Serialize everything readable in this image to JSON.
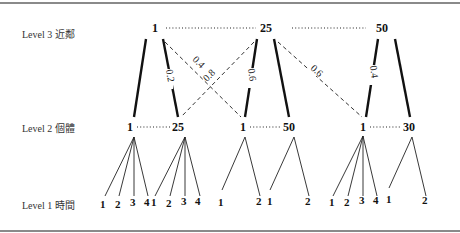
{
  "levels": [
    {
      "label": "Level 3 近鄰"
    },
    {
      "label": "Level 2 個體"
    },
    {
      "label": "Level 1 時間"
    }
  ],
  "level3": {
    "nodes": [
      "1",
      "25",
      "50"
    ]
  },
  "level2": {
    "nodes": [
      "1",
      "25",
      "1",
      "50",
      "1",
      "30"
    ]
  },
  "level1": {
    "groups": [
      {
        "leaves": [
          "1",
          "2",
          "3",
          "4"
        ]
      },
      {
        "leaves": [
          "1",
          "2",
          "3",
          "4"
        ]
      },
      {
        "leaves": [
          "1",
          "2"
        ]
      },
      {
        "leaves": [
          "1",
          "2"
        ]
      },
      {
        "leaves": [
          "1",
          "2",
          "3",
          "4"
        ]
      },
      {
        "leaves": [
          "1",
          "2"
        ]
      }
    ]
  },
  "weights": {
    "w1": "0.2",
    "w2": "0.4",
    "w3": "0.8",
    "w4": "0.6",
    "w5": "0.6",
    "w6": "0.4"
  }
}
